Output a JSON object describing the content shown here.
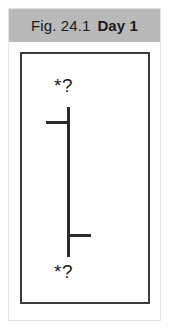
{
  "figure": {
    "caption_prefix": "Fig. 24.1",
    "caption_label": "Day 1",
    "panel_background": "#ffffff",
    "band_color": "#b9b9b9",
    "ink_color": "#2b2b2b"
  },
  "diagram": {
    "type": "schematic",
    "axis": {
      "orientation": "vertical",
      "top_y": 53,
      "bottom_y": 203,
      "x": 45,
      "thickness": 3
    },
    "ticks": [
      {
        "name": "upper-tick",
        "direction": "left",
        "y": 67,
        "length": 22,
        "thickness": 3
      },
      {
        "name": "lower-tick",
        "direction": "right",
        "y": 180,
        "length": 22,
        "thickness": 3
      }
    ],
    "labels": [
      {
        "name": "top-marker-label",
        "text": "*?",
        "position": "above-axis-top",
        "x": 32,
        "y": 22
      },
      {
        "name": "bottom-marker-label",
        "text": "*?",
        "position": "below-axis-bottom",
        "x": 32,
        "y": 208
      }
    ]
  }
}
